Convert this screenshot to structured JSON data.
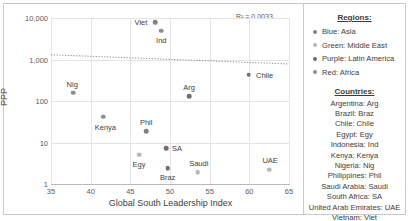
{
  "chart_data": {
    "type": "scatter",
    "title": "",
    "xlabel": "Global South Leadership Index",
    "ylabel": "PPP",
    "xlim": [
      35,
      65
    ],
    "ylim": [
      1,
      10000
    ],
    "yscale": "log",
    "xticks": [
      "35",
      "40",
      "45",
      "50",
      "55",
      "60",
      "65"
    ],
    "yticks": [
      "10,000",
      "1,000",
      "100",
      "10",
      "1"
    ],
    "grid": true,
    "annotation": "R² = 0.0033",
    "r2_value": 0.0033,
    "trendline": {
      "type": "linear",
      "y_left": 1300,
      "y_right": 780,
      "style": "dotted"
    },
    "points": [
      {
        "label": "Viet",
        "x": 48.1,
        "y": 7800,
        "region": "Asia",
        "color": "#808285",
        "label_dx": -14,
        "label_dy": 0
      },
      {
        "label": "Ind",
        "x": 48.9,
        "y": 4900,
        "region": "Asia",
        "color": "#8c8e90",
        "label_dx": 0,
        "label_dy": 9
      },
      {
        "label": "Chile",
        "x": 59.9,
        "y": 430,
        "region": "Latin America",
        "color": "#6d6f71",
        "label_dx": 16,
        "label_dy": 0
      },
      {
        "label": "Nig",
        "x": 37.8,
        "y": 160,
        "region": "Africa",
        "color": "#8c8e90",
        "label_dx": -1,
        "label_dy": -9
      },
      {
        "label": "Arg",
        "x": 52.4,
        "y": 130,
        "region": "Latin America",
        "color": "#6d6f71",
        "label_dx": 0,
        "label_dy": -9
      },
      {
        "label": "Kenya",
        "x": 41.6,
        "y": 42,
        "region": "Africa",
        "color": "#8c8e90",
        "label_dx": 2,
        "label_dy": 10
      },
      {
        "label": "Phil",
        "x": 47.0,
        "y": 19,
        "region": "Asia",
        "color": "#808285",
        "label_dx": 0,
        "label_dy": -9
      },
      {
        "label": "SA",
        "x": 49.5,
        "y": 7.2,
        "region": "Africa",
        "color": "#6d6f71",
        "label_dx": 11,
        "label_dy": 0
      },
      {
        "label": "Egy",
        "x": 46.1,
        "y": 5.1,
        "region": "Middle East",
        "color": "#b6b8ba",
        "label_dx": 0,
        "label_dy": 9
      },
      {
        "label": "Braz",
        "x": 49.7,
        "y": 2.4,
        "region": "Latin America",
        "color": "#6d6f71",
        "label_dx": 0,
        "label_dy": 9
      },
      {
        "label": "Saudi",
        "x": 53.5,
        "y": 1.95,
        "region": "Middle East",
        "color": "#b6b8ba",
        "label_dx": 1,
        "label_dy": -9
      },
      {
        "label": "UAE",
        "x": 62.5,
        "y": 2.2,
        "region": "Middle East",
        "color": "#b6b8ba",
        "label_dx": 1,
        "label_dy": -10
      }
    ]
  },
  "legend": {
    "regions_heading": "Regions:",
    "regions": [
      {
        "label": "Blue: Asia",
        "color": "#808285"
      },
      {
        "label": "Green: Middle East",
        "color": "#b6b8ba"
      },
      {
        "label": "Purple: Latin America",
        "color": "#6d6f71"
      },
      {
        "label": "Red: Africa",
        "color": "#8c8e90"
      }
    ],
    "countries_heading": "Countries:",
    "countries": [
      "Argentina: Arg",
      "Brazil: Braz",
      "Chile: Chile",
      "Egypt: Egy",
      "Indonesia: Ind",
      "Kenya: Kenya",
      "Nigeria: Nig",
      "Philippines: Phil",
      "Saudi Arabia: Saudi",
      "South Africa: SA",
      "United Arab Emirates: UAE",
      "Vietnam: Viet"
    ]
  }
}
